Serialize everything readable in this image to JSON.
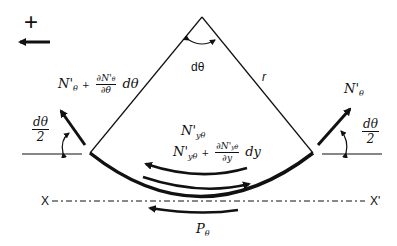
{
  "diagram": {
    "sign_convention": {
      "symbol": "+",
      "direction": "left"
    },
    "apex_angle_label": "dθ",
    "radius_label": "r",
    "left_force": {
      "base": "N'",
      "sub": "θ",
      "plus": "+",
      "frac_num": "∂N'",
      "frac_num_sub": "θ",
      "frac_den": "∂θ",
      "tail": "dθ"
    },
    "right_force": {
      "base": "N'",
      "sub": "θ"
    },
    "half_angle": {
      "num": "dθ",
      "den": "2"
    },
    "shear_force_top": {
      "base": "N'",
      "sub": "yθ"
    },
    "shear_force_bottom": {
      "base": "N'",
      "sub": "yθ",
      "plus": "+",
      "frac_num": "∂N'",
      "frac_num_sub": "yθ",
      "frac_den": "∂y",
      "tail": "dy"
    },
    "load_label": {
      "base": "P",
      "sub": "θ"
    },
    "axis": {
      "left": "X",
      "right": "X'"
    },
    "colors": {
      "stroke": "#111111",
      "background": "#ffffff"
    }
  }
}
